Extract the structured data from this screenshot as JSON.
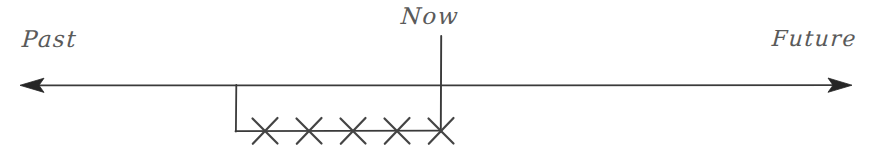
{
  "figure": {
    "background_color": "#ffffff",
    "stroke_color": "#3a3a3a",
    "label_color": "#5a5a5a"
  },
  "labels": {
    "past": "Past",
    "now": "Now",
    "future": "Future"
  },
  "axis": {
    "name": "time-axis",
    "y": 85,
    "left_tip_x": 20,
    "right_tip_x": 852,
    "left_arrow": "arrowhead-left",
    "right_arrow": "arrowhead-right"
  },
  "now_marker": {
    "name": "now-vertical-line",
    "x": 441,
    "top_y": 36,
    "bottom_y": 132
  },
  "interval": {
    "name": "crossed-interval",
    "bracket_left_x": 236,
    "bracket_top_y": 85,
    "baseline_y": 131,
    "baseline_right_x": 441,
    "cross_count": 5,
    "cross_positions": [
      265,
      309,
      353,
      397,
      441
    ],
    "cross_half_width": 13,
    "cross_half_height": 13,
    "cross_label": "x"
  }
}
